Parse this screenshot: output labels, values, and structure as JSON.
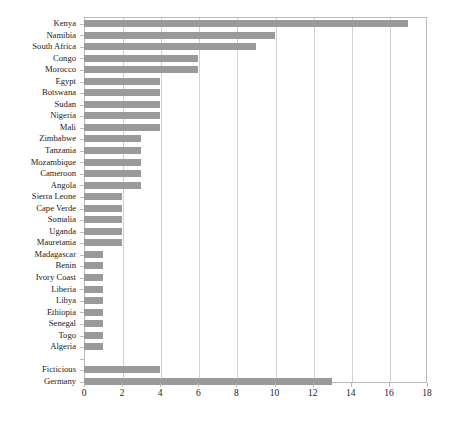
{
  "chart_data": {
    "type": "bar",
    "orientation": "horizontal",
    "title": "",
    "subtitle": "",
    "xlabel": "",
    "ylabel": "",
    "xlim": [
      0,
      18
    ],
    "xticks": [
      0,
      2,
      4,
      6,
      8,
      10,
      12,
      14,
      16,
      18
    ],
    "xtick_labels": [
      "0",
      "2",
      "4",
      "6",
      "8",
      "10",
      "12",
      "14",
      "16",
      "18"
    ],
    "grid": "vertical",
    "legend": "none",
    "bar_color": "#9a9a9a",
    "frame_color": "#b9b9b9",
    "gridline_color": "#d2d2d2",
    "categories": [
      "Kenya",
      "Namibia",
      "South Africa",
      "Congo",
      "Morocco",
      "Egypt",
      "Botswana",
      "Sudan",
      "Nigeria",
      "Mali",
      "Zimbabwe",
      "Tanzania",
      "Mozambique",
      "Cameroon",
      "Angola",
      "Sierra Leone",
      "Cape Verde",
      "Somalia",
      "Uganda",
      "Mauretania",
      "Madagascar",
      "Benin",
      "Ivory Coast",
      "Liberia",
      "Libya",
      "Ethiopia",
      "Senegal",
      "Togo",
      "Algeria",
      "",
      "Ficticious",
      "Germany"
    ],
    "values": [
      17,
      10,
      9,
      6,
      6,
      4,
      4,
      4,
      4,
      4,
      3,
      3,
      3,
      3,
      3,
      2,
      2,
      2,
      2,
      2,
      1,
      1,
      1,
      1,
      1,
      1,
      1,
      1,
      1,
      null,
      4,
      13
    ]
  }
}
